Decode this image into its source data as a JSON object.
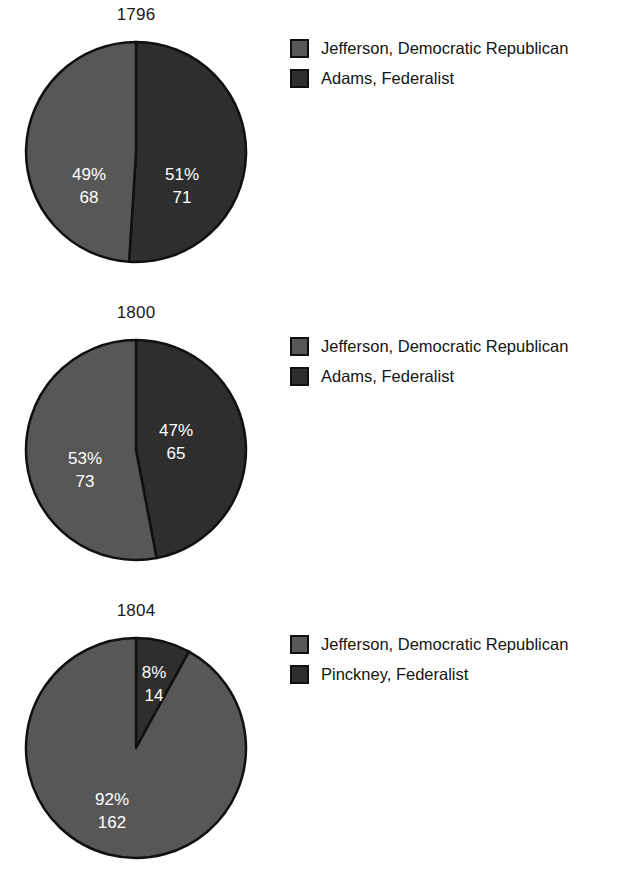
{
  "page": {
    "background_color": "#ffffff",
    "width": 640,
    "height": 892
  },
  "colors": {
    "republican": "#575757",
    "federalist": "#2e2e2e",
    "outline": "#101010",
    "label_text": "#ffffff",
    "title_text": "#1a1a1a"
  },
  "charts": [
    {
      "title": "1796",
      "slices": [
        {
          "label": "Adams, Federalist",
          "percent_label": "51%",
          "value_label": "71",
          "percent": 51,
          "value": 71,
          "color": "#2e2e2e"
        },
        {
          "label": "Jefferson, Democratic Republican",
          "percent_label": "49%",
          "value_label": "68",
          "percent": 49,
          "value": 68,
          "color": "#575757"
        }
      ],
      "legend": [
        {
          "label": "Jefferson, Democratic Republican",
          "color": "#575757"
        },
        {
          "label": "Adams, Federalist",
          "color": "#2e2e2e"
        }
      ]
    },
    {
      "title": "1800",
      "slices": [
        {
          "label": "Adams, Federalist",
          "percent_label": "47%",
          "value_label": "65",
          "percent": 47,
          "value": 65,
          "color": "#2e2e2e"
        },
        {
          "label": "Jefferson, Democratic Republican",
          "percent_label": "53%",
          "value_label": "73",
          "percent": 53,
          "value": 73,
          "color": "#575757"
        }
      ],
      "legend": [
        {
          "label": "Jefferson, Democratic Republican",
          "color": "#575757"
        },
        {
          "label": "Adams, Federalist",
          "color": "#2e2e2e"
        }
      ]
    },
    {
      "title": "1804",
      "slices": [
        {
          "label": "Pinckney, Federalist",
          "percent_label": "8%",
          "value_label": "14",
          "percent": 8,
          "value": 14,
          "color": "#2e2e2e"
        },
        {
          "label": "Jefferson, Democratic Republican",
          "percent_label": "92%",
          "value_label": "162",
          "percent": 92,
          "value": 162,
          "color": "#575757"
        }
      ],
      "legend": [
        {
          "label": "Jefferson, Democratic Republican",
          "color": "#575757"
        },
        {
          "label": "Pinckney, Federalist",
          "color": "#2e2e2e"
        }
      ]
    }
  ],
  "chart_data": [
    {
      "type": "pie",
      "title": "1796",
      "categories": [
        "Adams, Federalist",
        "Jefferson, Democratic Republican"
      ],
      "values": [
        71,
        68
      ],
      "percentages": [
        51,
        49
      ],
      "colors": [
        "#2e2e2e",
        "#575757"
      ],
      "start_angle_deg": 0,
      "direction": "clockwise",
      "legend_position": "right",
      "xlabel": "",
      "ylabel": ""
    },
    {
      "type": "pie",
      "title": "1800",
      "categories": [
        "Adams, Federalist",
        "Jefferson, Democratic Republican"
      ],
      "values": [
        65,
        73
      ],
      "percentages": [
        47,
        53
      ],
      "colors": [
        "#2e2e2e",
        "#575757"
      ],
      "start_angle_deg": 0,
      "direction": "clockwise",
      "legend_position": "right",
      "xlabel": "",
      "ylabel": ""
    },
    {
      "type": "pie",
      "title": "1804",
      "categories": [
        "Pinckney, Federalist",
        "Jefferson, Democratic Republican"
      ],
      "values": [
        14,
        162
      ],
      "percentages": [
        8,
        92
      ],
      "colors": [
        "#2e2e2e",
        "#575757"
      ],
      "start_angle_deg": 0,
      "direction": "clockwise",
      "legend_position": "right",
      "xlabel": "",
      "ylabel": ""
    }
  ]
}
